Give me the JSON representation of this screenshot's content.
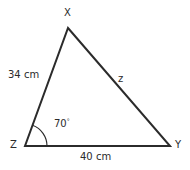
{
  "figure": {
    "type": "triangle-diagram",
    "background_color": "#ffffff",
    "stroke_color": "#2b2b2b",
    "text_color": "#2b2b2b"
  },
  "vertices": [
    {
      "name": "X",
      "label": "X",
      "x": 68,
      "y": 28,
      "label_x": 64,
      "label_y": 8
    },
    {
      "name": "Y",
      "label": "Y",
      "x": 170,
      "y": 146,
      "label_x": 175,
      "label_y": 140
    },
    {
      "name": "Z",
      "label": "Z",
      "x": 25,
      "y": 146,
      "label_x": 10,
      "label_y": 140
    }
  ],
  "sides": [
    {
      "name": "ZX",
      "label": "34 cm",
      "value": 34,
      "unit": "cm",
      "label_x": 8,
      "label_y": 70
    },
    {
      "name": "XY",
      "label": "z",
      "value": null,
      "unit": "",
      "label_x": 118,
      "label_y": 74
    },
    {
      "name": "ZY",
      "label": "40 cm",
      "value": 40,
      "unit": "cm",
      "label_x": 80,
      "label_y": 152
    }
  ],
  "angles": [
    {
      "at": "Z",
      "value": 70,
      "unit": "degrees",
      "label": "70",
      "degree_symbol": "°",
      "label_x": 54,
      "label_y": 118,
      "arc_radius": 22
    }
  ]
}
